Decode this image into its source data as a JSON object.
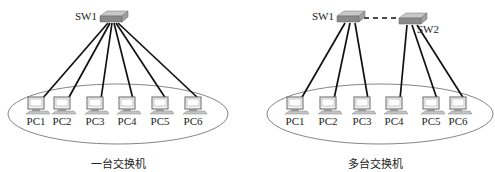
{
  "diagrams": [
    {
      "caption": "一台交换机",
      "switches": [
        {
          "label": "SW1",
          "x": 113,
          "y": 14
        }
      ],
      "switch_links": [],
      "pcs": [
        {
          "label": "PC1",
          "x": 36,
          "switch": 0
        },
        {
          "label": "PC2",
          "x": 62,
          "switch": 0
        },
        {
          "label": "PC3",
          "x": 95,
          "switch": 0
        },
        {
          "label": "PC4",
          "x": 127,
          "switch": 0
        },
        {
          "label": "PC5",
          "x": 160,
          "switch": 0
        },
        {
          "label": "PC6",
          "x": 193,
          "switch": 0
        }
      ]
    },
    {
      "caption": "多台交换机",
      "switches": [
        {
          "label": "SW1",
          "x": 350,
          "y": 14
        },
        {
          "label": "SW2",
          "x": 412,
          "y": 16
        }
      ],
      "switch_links": [
        {
          "from": 0,
          "to": 1,
          "style": "dashed"
        }
      ],
      "pcs": [
        {
          "label": "PC1",
          "x": 295,
          "switch": 0
        },
        {
          "label": "PC2",
          "x": 328,
          "switch": 0
        },
        {
          "label": "PC3",
          "x": 362,
          "switch": 0
        },
        {
          "label": "PC4",
          "x": 394,
          "switch": 1
        },
        {
          "label": "PC5",
          "x": 431,
          "switch": 1
        },
        {
          "label": "PC6",
          "x": 458,
          "switch": 1
        }
      ]
    }
  ],
  "colors": {
    "line": "#111111",
    "ellipse": "#555555",
    "switch_top": "#c8c8c8",
    "switch_side": "#8a8a8a",
    "pc_body": "#e8e8e8",
    "pc_edge": "#666666"
  }
}
